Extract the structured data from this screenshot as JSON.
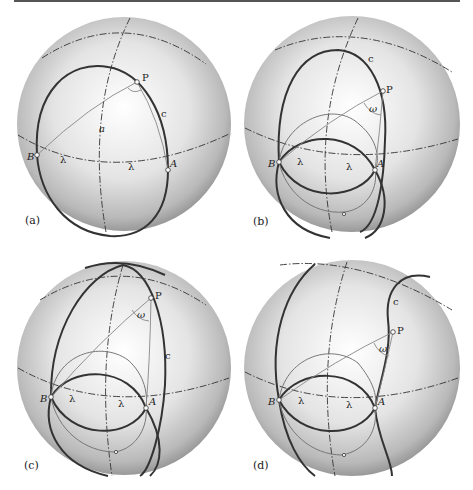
{
  "figure": {
    "panels": [
      {
        "id": "a",
        "label": "(a)",
        "points": {
          "P": "P",
          "A": "A",
          "B": "B"
        },
        "curve_label": "c",
        "arc_label": "a",
        "lambda_label": "λ",
        "angle_label": "right angle"
      },
      {
        "id": "b",
        "label": "(b)",
        "points": {
          "P": "P",
          "A": "A",
          "B": "B"
        },
        "curve_label": "c",
        "lambda_label": "λ",
        "angle_label": "ω"
      },
      {
        "id": "c",
        "label": "(c)",
        "points": {
          "P": "P",
          "A": "A",
          "B": "B"
        },
        "curve_label": "c",
        "lambda_label": "λ",
        "angle_label": "ω"
      },
      {
        "id": "d",
        "label": "(d)",
        "points": {
          "P": "P",
          "A": "A",
          "B": "B"
        },
        "curve_label": "c",
        "lambda_label": "λ",
        "angle_label": "ω"
      }
    ]
  },
  "colors": {
    "sphere_light": "#ffffff",
    "sphere_dark": "#8c8c8c",
    "line": "#333333"
  }
}
